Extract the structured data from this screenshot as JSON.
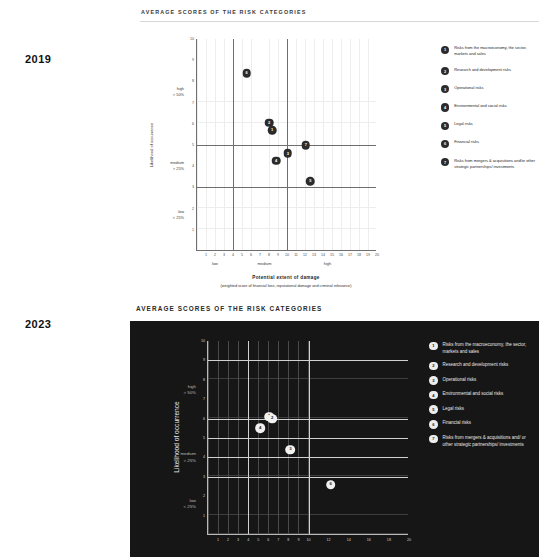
{
  "page": {
    "background": "#ffffff",
    "dark_panel_color": "#161616"
  },
  "charts": [
    {
      "year_label": "2019",
      "title": "AVERAGE SCORES OF THE RISK CATEGORIES",
      "theme": "light",
      "chart_data": {
        "type": "scatter",
        "title": "AVERAGE SCORES OF THE RISK CATEGORIES",
        "xlabel": "Potential extent of damage",
        "xsublabel": "(weighted score of financial loss, reputational damage and criminal relevance)",
        "ylabel": "Likelihood of occurrence",
        "xlim": [
          0,
          20
        ],
        "ylim": [
          0,
          10
        ],
        "grid": true,
        "legend_position": "right",
        "x_ticks": [
          1,
          2,
          3,
          4,
          5,
          6,
          7,
          8,
          9,
          10,
          11,
          12,
          13,
          14,
          15,
          16,
          17,
          18,
          19,
          20
        ],
        "y_ticks": [
          1,
          2,
          3,
          4,
          5,
          6,
          7,
          8,
          9,
          10
        ],
        "x_bands": [
          {
            "label": "low",
            "at": 2
          },
          {
            "label": "medium",
            "at": 7.5
          },
          {
            "label": "high",
            "at": 14.5
          }
        ],
        "y_bands": [
          {
            "label": "high\n> 50%",
            "line1": "high",
            "line2": "> 50%",
            "at": 7.5
          },
          {
            "label": "medium\n> 25%",
            "line1": "medium",
            "line2": "> 25%",
            "at": 4
          },
          {
            "label": "low\n< 25%",
            "line1": "low",
            "line2": "< 25%",
            "at": 1.7
          }
        ],
        "quadrant_lines": {
          "vertical": [
            4,
            10
          ],
          "horizontal": [
            3,
            5
          ]
        },
        "points": [
          {
            "id": "6",
            "x": 5.5,
            "y": 8.4
          },
          {
            "id": "2",
            "x": 8.0,
            "y": 6.05
          },
          {
            "id": "1",
            "x": 8.35,
            "y": 5.7
          },
          {
            "id": "7",
            "x": 12.1,
            "y": 5.0
          },
          {
            "id": "3",
            "x": 10.1,
            "y": 4.6
          },
          {
            "id": "4",
            "x": 8.8,
            "y": 4.25
          },
          {
            "id": "5",
            "x": 12.6,
            "y": 3.3
          }
        ]
      },
      "legend": [
        {
          "id": "1",
          "label": "Risks from the macroeconomy, the sector, markets and sales"
        },
        {
          "id": "2",
          "label": "Research and development risks"
        },
        {
          "id": "3",
          "label": "Operational risks"
        },
        {
          "id": "4",
          "label": "Environmental and social risks"
        },
        {
          "id": "5",
          "label": "Legal risks"
        },
        {
          "id": "6",
          "label": "Financial risks"
        },
        {
          "id": "7",
          "label": "Risks from mergers & acquisitions and/or other strategic partnerships/ investments"
        }
      ]
    },
    {
      "year_label": "2023",
      "title": "AVERAGE SCORES OF THE RISK CATEGORIES",
      "theme": "dark",
      "chart_data": {
        "type": "scatter",
        "title": "AVERAGE SCORES OF THE RISK CATEGORIES",
        "xlabel": "",
        "ylabel": "Likelihood of occurrence",
        "xlim": [
          0,
          20
        ],
        "ylim": [
          0,
          10
        ],
        "grid": true,
        "legend_position": "right",
        "x_ticks": [
          1,
          2,
          3,
          4,
          5,
          6,
          7,
          8,
          9,
          10,
          12,
          14,
          16,
          18,
          20
        ],
        "y_ticks": [
          1,
          2,
          3,
          4,
          5,
          6,
          7,
          8,
          9,
          10
        ],
        "y_bands": [
          {
            "line1": "high",
            "line2": "> 50%",
            "at": 7.5
          },
          {
            "line1": "medium",
            "line2": "> 25%",
            "at": 4
          },
          {
            "line1": "low",
            "line2": "< 25%",
            "at": 1.6
          }
        ],
        "major_lines": {
          "horizontal": [
            3,
            4,
            5,
            6,
            9
          ],
          "vertical": [
            4,
            10
          ]
        },
        "points": [
          {
            "id": "1",
            "x": 6.1,
            "y": 6.1
          },
          {
            "id": "2",
            "x": 6.4,
            "y": 6.0
          },
          {
            "id": "4",
            "x": 5.2,
            "y": 5.5
          },
          {
            "id": "3",
            "x": 8.2,
            "y": 4.4
          },
          {
            "id": "6",
            "x": 12.2,
            "y": 2.6
          }
        ]
      },
      "legend": [
        {
          "id": "1",
          "label": "Risks from the macroeconomy, the sector, markets and sales"
        },
        {
          "id": "2",
          "label": "Research and development risks"
        },
        {
          "id": "3",
          "label": "Operational risks"
        },
        {
          "id": "4",
          "label": "Environmental and social risks"
        },
        {
          "id": "5",
          "label": "Legal risks"
        },
        {
          "id": "6",
          "label": "Financial risks"
        },
        {
          "id": "7",
          "label": "Risks from mergers & acquisitions and/ or other strategic partnerships/ investments"
        }
      ]
    }
  ]
}
